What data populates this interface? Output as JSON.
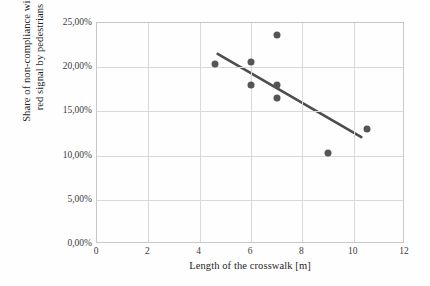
{
  "chart_data": {
    "type": "scatter",
    "title": "",
    "xlabel": "Length of the crosswalk [m]",
    "ylabel_lines": [
      "Share of non-compliance with",
      "red signal by pedestrians"
    ],
    "ylabel": "Share of non-compliance with red signal by pedestrians",
    "xlim": [
      0,
      12
    ],
    "ylim": [
      0,
      25
    ],
    "xticks": [
      0,
      2,
      4,
      6,
      8,
      10,
      12
    ],
    "xtick_labels": [
      "0",
      "2",
      "4",
      "6",
      "8",
      "10",
      "12"
    ],
    "yticks": [
      0,
      5,
      10,
      15,
      20,
      25
    ],
    "ytick_labels": [
      "0,00%",
      "5,00%",
      "10,00%",
      "15,00%",
      "20,00%",
      "25,00%"
    ],
    "grid": true,
    "legend": false,
    "marker_color": "#555555",
    "trendline_color": "#4d4d4d",
    "grid_color": "#d9d9d9",
    "axis_color": "#c8c8c8",
    "points": [
      {
        "x": 4.6,
        "y": 20.4
      },
      {
        "x": 6.0,
        "y": 20.6
      },
      {
        "x": 6.0,
        "y": 18.0
      },
      {
        "x": 7.0,
        "y": 23.6
      },
      {
        "x": 7.0,
        "y": 18.0
      },
      {
        "x": 7.0,
        "y": 16.5
      },
      {
        "x": 9.0,
        "y": 10.3
      },
      {
        "x": 10.5,
        "y": 13.0
      }
    ],
    "trendline": {
      "x_start": 4.7,
      "y_start": 21.5,
      "x_end": 10.3,
      "y_end": 12.1
    }
  }
}
